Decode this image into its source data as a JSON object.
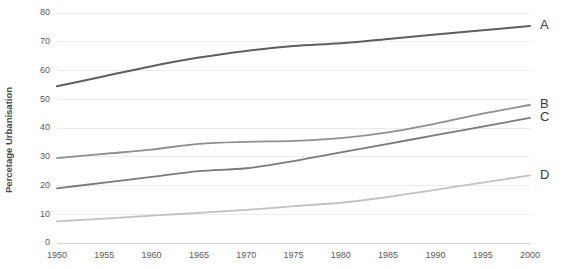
{
  "chart_data": {
    "type": "line",
    "title": "",
    "subtitle": "",
    "xlabel": "",
    "ylabel": "Percetage Urbanisation",
    "xlim": [
      1950,
      2000
    ],
    "ylim": [
      0,
      80
    ],
    "grid": true,
    "grid_axis": "y",
    "legend_position": "right-end-labels",
    "x": [
      1950,
      1955,
      1960,
      1965,
      1970,
      1975,
      1980,
      1985,
      1990,
      1995,
      2000
    ],
    "x_tick_labels": [
      "1950",
      "1955",
      "1960",
      "1965",
      "1970",
      "1975",
      "1980",
      "1985",
      "1990",
      "1995",
      "2000"
    ],
    "y_ticks": [
      0,
      10,
      20,
      30,
      40,
      50,
      60,
      70,
      80
    ],
    "y_tick_labels": [
      "0",
      "10",
      "20",
      "30",
      "40",
      "50",
      "60",
      "70",
      "80"
    ],
    "series": [
      {
        "name": "A",
        "label": "A",
        "color": "#5f5f5f",
        "width": 2.0,
        "values": [
          54.5,
          58.0,
          61.5,
          64.5,
          66.8,
          68.5,
          69.5,
          71.0,
          72.5,
          74.0,
          75.5
        ]
      },
      {
        "name": "B",
        "label": "B",
        "color": "#8f8f8f",
        "width": 1.8,
        "values": [
          29.5,
          31.0,
          32.5,
          34.5,
          35.2,
          35.5,
          36.5,
          38.5,
          41.5,
          45.0,
          48.0
        ]
      },
      {
        "name": "C",
        "label": "C",
        "color": "#7a7a7a",
        "width": 1.8,
        "values": [
          19.0,
          21.0,
          23.0,
          25.0,
          26.0,
          28.5,
          31.5,
          34.5,
          37.5,
          40.5,
          43.5
        ]
      },
      {
        "name": "D",
        "label": "D",
        "color": "#c2c2c2",
        "width": 1.8,
        "values": [
          7.5,
          8.5,
          9.5,
          10.5,
          11.5,
          12.8,
          14.0,
          16.0,
          18.5,
          21.0,
          23.5
        ]
      }
    ]
  },
  "colors": {
    "background": "#ffffff",
    "grid": "#ececec",
    "axis": "#d8d8d8",
    "tick_text": "#5a5a5a",
    "axis_title": "#4a4a4a",
    "series_label": "#3a3a3a"
  }
}
